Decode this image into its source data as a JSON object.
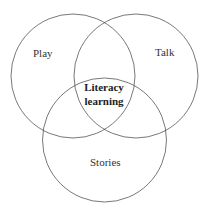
{
  "diagram": {
    "type": "venn",
    "circles": [
      {
        "label": "Play",
        "cx": 73,
        "cy": 76,
        "r": 62
      },
      {
        "label": "Talk",
        "cx": 136,
        "cy": 76,
        "r": 62
      },
      {
        "label": "Stories",
        "cx": 104.5,
        "cy": 140,
        "r": 62
      }
    ],
    "center_label": [
      "Literacy",
      "learning"
    ],
    "stroke_color": "#555555"
  }
}
